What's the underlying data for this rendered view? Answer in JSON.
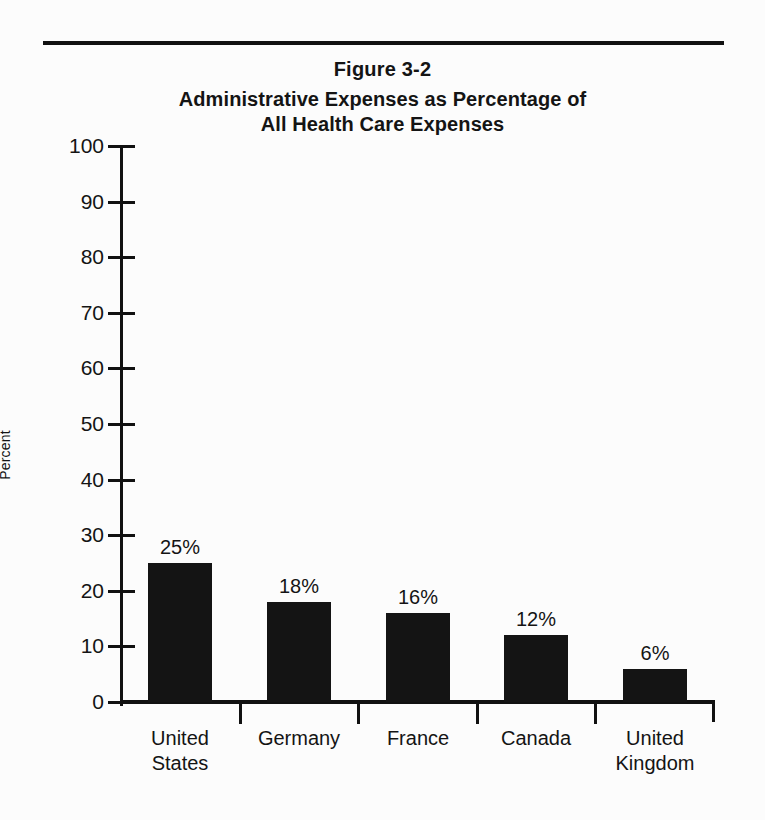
{
  "figure": {
    "number": "Figure 3-2",
    "title": "Administrative Expenses as Percentage of All Health Care Expenses",
    "title_line1": "Administrative Expenses as Percentage of",
    "title_line2": "All Health Care Expenses"
  },
  "chart_data": {
    "type": "bar",
    "title": "Administrative Expenses as Percentage of All Health Care Expenses",
    "subtitle": "Figure 3-2",
    "xlabel": "",
    "ylabel": "Percent",
    "ylim": [
      0,
      100
    ],
    "ytick_step": 10,
    "yticks": [
      0,
      10,
      20,
      30,
      40,
      50,
      60,
      70,
      80,
      90,
      100
    ],
    "ytick_labels": [
      "0",
      "10",
      "20",
      "30",
      "40",
      "50",
      "60",
      "70",
      "80",
      "90",
      "100"
    ],
    "grid": false,
    "legend": null,
    "bar_color": "#141414",
    "categories": [
      "United States",
      "Germany",
      "France",
      "Canada",
      "United Kingdom"
    ],
    "category_lines": [
      [
        "United",
        "States"
      ],
      [
        "Germany"
      ],
      [
        "France"
      ],
      [
        "Canada"
      ],
      [
        "United",
        "Kingdom"
      ]
    ],
    "values": [
      25,
      18,
      16,
      12,
      6
    ],
    "value_labels": [
      "25%",
      "18%",
      "16%",
      "12%",
      "6%"
    ]
  },
  "colors": {
    "background": "#fcfcfc",
    "ink": "#141414",
    "rule": "#111111"
  }
}
